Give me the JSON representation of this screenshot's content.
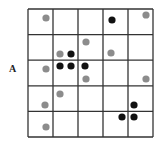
{
  "figure": {
    "label": "A",
    "grid": {
      "rows": 5,
      "cols": 5,
      "x0": 28,
      "y0": 9,
      "cell_w": 25,
      "cell_h": 25.6,
      "line_color": "#333333"
    },
    "colors": {
      "gray": "#8c8c8c",
      "black": "#111111"
    },
    "dots": [
      {
        "x": 46,
        "y": 18,
        "color": "gray"
      },
      {
        "x": 112,
        "y": 20,
        "color": "black"
      },
      {
        "x": 146,
        "y": 15,
        "color": "gray"
      },
      {
        "x": 86,
        "y": 42,
        "color": "gray"
      },
      {
        "x": 60,
        "y": 54,
        "color": "gray"
      },
      {
        "x": 71,
        "y": 54,
        "color": "black"
      },
      {
        "x": 111,
        "y": 53,
        "color": "gray"
      },
      {
        "x": 46,
        "y": 69,
        "color": "gray"
      },
      {
        "x": 60,
        "y": 66,
        "color": "black"
      },
      {
        "x": 71,
        "y": 66,
        "color": "black"
      },
      {
        "x": 85,
        "y": 66,
        "color": "black"
      },
      {
        "x": 86,
        "y": 79,
        "color": "gray"
      },
      {
        "x": 146,
        "y": 79,
        "color": "gray"
      },
      {
        "x": 60,
        "y": 94,
        "color": "gray"
      },
      {
        "x": 45,
        "y": 105,
        "color": "gray"
      },
      {
        "x": 134,
        "y": 105,
        "color": "black"
      },
      {
        "x": 122,
        "y": 117,
        "color": "black"
      },
      {
        "x": 134,
        "y": 117,
        "color": "black"
      },
      {
        "x": 46,
        "y": 127,
        "color": "gray"
      }
    ]
  }
}
